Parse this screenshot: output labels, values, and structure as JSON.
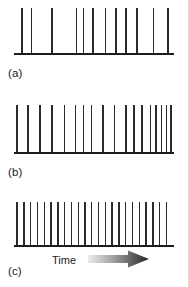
{
  "figure": {
    "background_color": "#ffffff",
    "spike_color": "#2b2b2b",
    "baseline_color": "#1c1c1c",
    "axis_label": "Time",
    "arrow_gradient_from": "#e8e8e8",
    "arrow_gradient_to": "#2a2a2a"
  },
  "panels": [
    {
      "label": "(a)",
      "label_text": "(a)",
      "description": "sparse irregular spike train"
    },
    {
      "label": "(b)",
      "label_text": "(b)",
      "description": "medium density spike train"
    },
    {
      "label": "(c)",
      "label_text": "(c)",
      "description": "dense regular spike train"
    }
  ],
  "chart_data": {
    "type": "scatter",
    "title": "",
    "xlabel": "Time",
    "ylabel": "",
    "grid": false,
    "legend": "none",
    "xlim": [
      0,
      100
    ],
    "ylim": [
      0,
      1
    ],
    "series": [
      {
        "name": "(a)",
        "panel": "a",
        "spike_count": 12,
        "spike_height_pct": 100,
        "x": [
          4.5,
          10.5,
          23.5,
          39.0,
          43.5,
          49.5,
          57.5,
          64.0,
          70.5,
          77.5,
          88.0,
          97.0
        ]
      },
      {
        "name": "(b)",
        "panel": "b",
        "spike_count": 18,
        "spike_height_pct": 100,
        "x": [
          1.5,
          8.5,
          16.0,
          23.5,
          31.5,
          38.5,
          43.5,
          48.5,
          56.0,
          63.0,
          70.5,
          75.5,
          80.5,
          86.0,
          89.5,
          93.0,
          96.0,
          99.0
        ]
      },
      {
        "name": "(c)",
        "panel": "c",
        "spike_count": 23,
        "spike_height_pct": 100,
        "x": [
          1.5,
          5.8,
          10.1,
          14.4,
          18.7,
          23.0,
          27.3,
          31.6,
          35.9,
          40.2,
          44.5,
          48.8,
          53.1,
          57.4,
          61.7,
          66.0,
          70.3,
          74.6,
          78.9,
          83.2,
          87.5,
          91.8,
          96.1
        ]
      }
    ]
  }
}
